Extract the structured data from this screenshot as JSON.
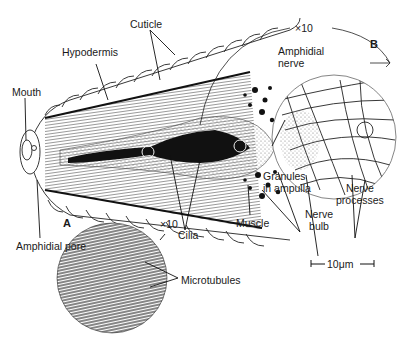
{
  "labels": {
    "cuticle": "Cuticle",
    "hypodermis": "Hypodermis",
    "mouth": "Mouth",
    "amphidial_pore": "Amphidial pore",
    "amphidial_nerve_1": "Amphidial",
    "amphidial_nerve_2": "nerve",
    "granules_1": "Granules",
    "granules_2": "in ampulla",
    "cilia": "Cilia",
    "muscle": "Muscle",
    "nerve_bulb_1": "Nerve",
    "nerve_bulb_2": "bulb",
    "nerve_processes_1": "Nerve",
    "nerve_processes_2": "processes",
    "microtubules": "Microtubules"
  },
  "insets": {
    "a": {
      "letter": "A",
      "magnification": "×10"
    },
    "b": {
      "letter": "B",
      "magnification": "×10"
    }
  },
  "scale_bar": {
    "label": "10μm"
  },
  "colors": {
    "ink": "#1a1a1a",
    "background": "#ffffff",
    "stipple": "#8a8a8a"
  }
}
